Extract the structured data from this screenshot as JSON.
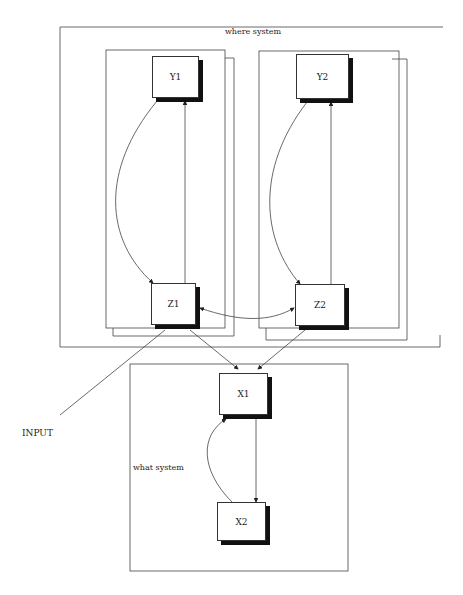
{
  "diagram": {
    "groups": {
      "where": {
        "label": "where system"
      },
      "what": {
        "label": "what system"
      }
    },
    "nodes": {
      "y1": {
        "label": "Y1"
      },
      "y2": {
        "label": "Y2"
      },
      "z1": {
        "label": "Z1"
      },
      "z2": {
        "label": "Z2"
      },
      "x1": {
        "label": "X1"
      },
      "x2": {
        "label": "X2"
      }
    },
    "input_label": "INPUT",
    "edges": [
      {
        "from": "Y1",
        "to": "Z1",
        "type": "curved"
      },
      {
        "from": "Z1",
        "to": "Y1",
        "type": "straight"
      },
      {
        "from": "Y2",
        "to": "Z2",
        "type": "curved"
      },
      {
        "from": "Z2",
        "to": "Y2",
        "type": "straight"
      },
      {
        "from": "Z1",
        "to": "Z2",
        "type": "bidirectional-curved"
      },
      {
        "from": "Z1",
        "to": "X1",
        "type": "straight"
      },
      {
        "from": "Z2",
        "to": "X1",
        "type": "straight"
      },
      {
        "from": "X1",
        "to": "X2",
        "type": "straight"
      },
      {
        "from": "X2",
        "to": "X1",
        "type": "curved"
      },
      {
        "from": "INPUT",
        "to": "Z1",
        "type": "straight"
      }
    ],
    "colors": {
      "line": "#333333",
      "shadow": "#111111",
      "background": "#ffffff"
    }
  }
}
